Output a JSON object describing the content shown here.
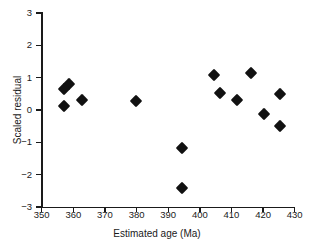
{
  "chart_data": {
    "type": "scatter",
    "title": "",
    "xlabel": "Estimated age (Ma)",
    "ylabel": "Scaled residual",
    "xlim": [
      350,
      430
    ],
    "ylim": [
      -3,
      3
    ],
    "xticks": [
      350,
      360,
      370,
      380,
      390,
      400,
      410,
      420,
      430
    ],
    "xtick_labels": [
      "350",
      "360",
      "370",
      "380",
      "390",
      "400",
      "410",
      "420",
      "430"
    ],
    "yticks": [
      -3,
      -2,
      -1,
      0,
      1,
      2,
      3
    ],
    "ytick_labels": [
      "-3",
      "-2",
      "-1",
      "0",
      "1",
      "2",
      "3"
    ],
    "grid": false,
    "legend": null,
    "marker": "diamond",
    "marker_color": "#111111",
    "points": [
      {
        "x": 358.5,
        "y": 0.8
      },
      {
        "x": 357.2,
        "y": 0.65
      },
      {
        "x": 357.2,
        "y": 0.12
      },
      {
        "x": 362.6,
        "y": 0.3
      },
      {
        "x": 379.8,
        "y": 0.29
      },
      {
        "x": 394.4,
        "y": -1.16
      },
      {
        "x": 394.4,
        "y": -2.4
      },
      {
        "x": 404.5,
        "y": 1.08
      },
      {
        "x": 406.3,
        "y": 0.54
      },
      {
        "x": 411.6,
        "y": 0.31
      },
      {
        "x": 416.2,
        "y": 1.15
      },
      {
        "x": 420.4,
        "y": -0.11
      },
      {
        "x": 425.3,
        "y": 0.49
      },
      {
        "x": 425.3,
        "y": -0.5
      }
    ]
  },
  "axes": {
    "x_title": "Estimated age (Ma)",
    "y_title": "Scaled residual"
  }
}
